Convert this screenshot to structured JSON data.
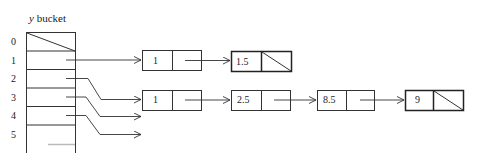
{
  "title": {
    "var": "y",
    "text": " bucket"
  },
  "bucket": {
    "x": 26,
    "y": 32,
    "width": 49,
    "row_height": 18.6,
    "indices": [
      "0",
      "1",
      "2",
      "3",
      "4",
      "5"
    ],
    "null_slot": "0"
  },
  "nodes": [
    {
      "id": "n1a",
      "value": "1",
      "x": 142,
      "y": 50,
      "w": 59,
      "h": 20,
      "div": 30,
      "next_null": false
    },
    {
      "id": "n15",
      "value": "1.5",
      "x": 231,
      "y": 51,
      "w": 60,
      "h": 20,
      "div": 30,
      "next_null": true
    },
    {
      "id": "n1b",
      "value": "1",
      "x": 142,
      "y": 90,
      "w": 59,
      "h": 20,
      "div": 30,
      "next_null": false
    },
    {
      "id": "n25",
      "value": "2.5",
      "x": 231,
      "y": 90,
      "w": 59,
      "h": 20,
      "div": 30,
      "next_null": false
    },
    {
      "id": "n85",
      "value": "8.5",
      "x": 317,
      "y": 90,
      "w": 57,
      "h": 20,
      "div": 29,
      "next_null": false
    },
    {
      "id": "n9",
      "value": "9",
      "x": 405,
      "y": 90,
      "w": 58,
      "h": 20,
      "div": 28,
      "next_null": true
    }
  ],
  "stroke_color": "#333333"
}
